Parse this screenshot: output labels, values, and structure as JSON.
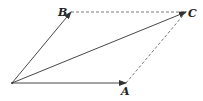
{
  "diagram": {
    "type": "vector-parallelogram",
    "points": {
      "O": {
        "x": 12,
        "y": 83,
        "label": ""
      },
      "A": {
        "x": 126,
        "y": 83,
        "label": "A"
      },
      "B": {
        "x": 71,
        "y": 12,
        "label": "B"
      },
      "C": {
        "x": 186,
        "y": 12,
        "label": "C"
      }
    },
    "vectors": [
      {
        "from": "O",
        "to": "A",
        "style": "solid-arrow"
      },
      {
        "from": "O",
        "to": "B",
        "style": "solid-arrow"
      },
      {
        "from": "O",
        "to": "C",
        "style": "solid-arrow"
      }
    ],
    "dashed_edges": [
      {
        "from": "B",
        "to": "C"
      },
      {
        "from": "A",
        "to": "C"
      }
    ],
    "labels": {
      "A": "A",
      "B": "B",
      "C": "C"
    },
    "colors": {
      "line": "#333333",
      "background": "#ffffff"
    }
  }
}
